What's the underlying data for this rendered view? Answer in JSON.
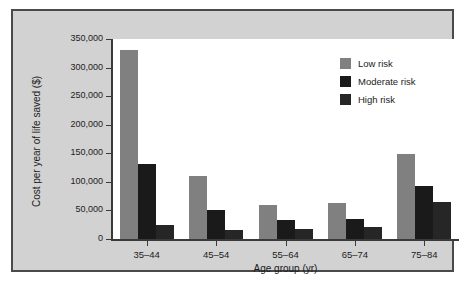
{
  "chart_data": {
    "type": "bar",
    "title": "",
    "xlabel": "Age group (yr)",
    "ylabel": "Cost per year of life saved ($)",
    "categories": [
      "35–44",
      "45–54",
      "55–64",
      "65–74",
      "75–84"
    ],
    "series": [
      {
        "name": "Low risk",
        "color": "#808080",
        "values": [
          330000,
          110000,
          60000,
          63000,
          148000
        ]
      },
      {
        "name": "Moderate risk",
        "color": "#1a1a1a",
        "values": [
          131000,
          50000,
          33000,
          35000,
          93000
        ]
      },
      {
        "name": "High risk",
        "color": "#262626",
        "values": [
          25000,
          15000,
          17000,
          21000,
          65000
        ]
      }
    ],
    "ylim": [
      0,
      350000
    ],
    "ytick_values": [
      0,
      50000,
      100000,
      150000,
      200000,
      250000,
      300000,
      350000
    ],
    "ytick_labels": [
      "0",
      "50,000",
      "100,000",
      "150,000",
      "200,000",
      "250,000",
      "300,000",
      "350,000"
    ],
    "grid": false,
    "legend_position": "top-right",
    "legend": [
      {
        "label": "Low risk",
        "color": "#808080"
      },
      {
        "label": "Moderate risk",
        "color": "#1a1a1a"
      },
      {
        "label": "High risk",
        "color": "#262626"
      }
    ]
  },
  "figure": {
    "panel_background": "#d2d2d2",
    "plot_background": "#ffffff",
    "frame_color": "#4a4a4a",
    "axis_color": "#3a3a3a",
    "text_color": "#1c1c1c"
  }
}
